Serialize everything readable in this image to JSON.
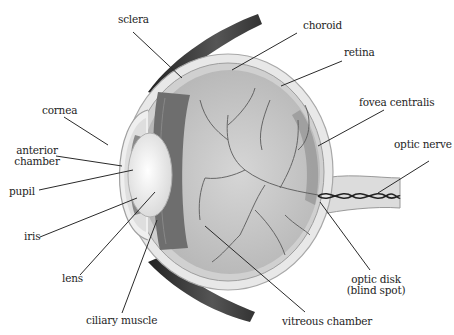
{
  "diagram": {
    "colors": {
      "label_text": "#1e1e1e",
      "leader_line": "#2a2a2a",
      "sclera": "#e6e6e6",
      "vitreous": "#c4c4c4",
      "muscle": "#3c3c3c",
      "lens": "#f2f2f2",
      "ciliary_band": "#6e6e6e"
    },
    "labels": {
      "sclera": "sclera",
      "choroid": "choroid",
      "retina": "retina",
      "cornea": "cornea",
      "fovea_centralis": "fovea centralis",
      "anterior_chamber_line1": "anterior",
      "anterior_chamber_line2": "chamber",
      "optic_nerve": "optic nerve",
      "pupil": "pupil",
      "iris": "iris",
      "lens": "lens",
      "optic_disk_line1": "optic disk",
      "optic_disk_line2": "(blind spot)",
      "ciliary_muscle": "ciliary muscle",
      "vitreous_chamber": "vitreous chamber"
    }
  }
}
